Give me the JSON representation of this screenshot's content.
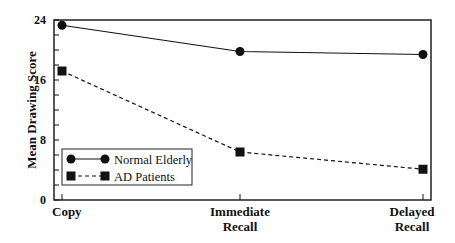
{
  "chart_data": {
    "type": "line",
    "title": "",
    "xlabel": "",
    "ylabel": "Mean Drawing Score",
    "categories": [
      "Copy",
      "Immediate Recall",
      "Delayed Recall"
    ],
    "category_lines": [
      [
        "Copy"
      ],
      [
        "Immediate",
        "Recall"
      ],
      [
        "Delayed",
        "Recall"
      ]
    ],
    "ylim": [
      0,
      24
    ],
    "yticks": [
      0,
      8,
      16,
      24
    ],
    "grid": false,
    "legend_position": "lower left (inside)",
    "series": [
      {
        "name": "Normal Elderly",
        "marker": "circle",
        "line": "solid",
        "values": [
          23.3,
          19.8,
          19.4
        ]
      },
      {
        "name": "AD Patients",
        "marker": "square",
        "line": "dashed",
        "values": [
          17.2,
          6.4,
          4.1
        ]
      }
    ]
  },
  "colors": {
    "line": "#111111",
    "frame": "#222222",
    "background": "#ffffff"
  }
}
